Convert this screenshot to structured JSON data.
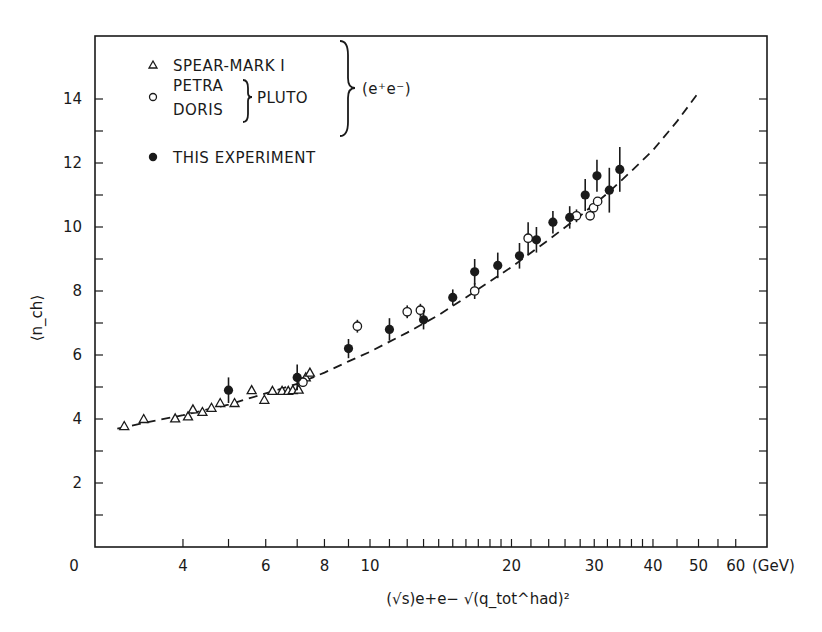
{
  "colors": {
    "ink": "#1a1a1a",
    "background": "#ffffff"
  },
  "chart_data": {
    "type": "scatter",
    "title": "",
    "xlabel": "(√s)e+e−  √(q_tot^had)²",
    "xunit": "(GeV)",
    "ylabel": "⟨n_ch⟩",
    "xscale": "log",
    "xlim": [
      2.35,
      70
    ],
    "ylim": [
      0,
      15.8
    ],
    "x_tick_labels": [
      {
        "value": 4,
        "label": "4"
      },
      {
        "value": 6,
        "label": "6"
      },
      {
        "value": 8,
        "label": "8"
      },
      {
        "value": 10,
        "label": "10"
      },
      {
        "value": 20,
        "label": "20"
      },
      {
        "value": 30,
        "label": "30"
      },
      {
        "value": 40,
        "label": "40"
      },
      {
        "value": 50,
        "label": "50"
      },
      {
        "value": 60,
        "label": "60"
      }
    ],
    "x_origin_label": "0",
    "x_minor_ticks": [
      4,
      5,
      6,
      7,
      8,
      9,
      10,
      11,
      12,
      13,
      14,
      15,
      16,
      17,
      18,
      19,
      20,
      22,
      24,
      26,
      28,
      30,
      32,
      34,
      36,
      38,
      40,
      45,
      50,
      55,
      60
    ],
    "y_tick_labels": [
      {
        "value": 2,
        "label": "2"
      },
      {
        "value": 4,
        "label": "4"
      },
      {
        "value": 6,
        "label": "6"
      },
      {
        "value": 8,
        "label": "8"
      },
      {
        "value": 10,
        "label": "10"
      },
      {
        "value": 12,
        "label": "12"
      },
      {
        "value": 14,
        "label": "14"
      }
    ],
    "y_origin_label": "0",
    "y_minor_ticks": [
      1,
      2,
      3,
      4,
      5,
      6,
      7,
      8,
      9,
      10,
      11,
      12,
      13,
      14
    ],
    "grid": false,
    "legend": {
      "position": "upper-left",
      "entries": [
        {
          "marker": "triangle-open",
          "label": "SPEAR-MARK I"
        },
        {
          "marker": "circle-open",
          "labels": [
            "PETRA",
            "DORIS"
          ],
          "group_label": "PLUTO"
        },
        {
          "marker": "circle-filled",
          "label": "THIS EXPERIMENT"
        }
      ],
      "outer_group_label": "(e⁺e⁻)"
    },
    "series": [
      {
        "name": "SPEAR-MARK I (e+e-)",
        "marker": "triangle-open",
        "points": [
          {
            "x": 3.0,
            "y": 3.78
          },
          {
            "x": 3.3,
            "y": 4.0
          },
          {
            "x": 3.85,
            "y": 4.02
          },
          {
            "x": 4.1,
            "y": 4.08
          },
          {
            "x": 4.2,
            "y": 4.3
          },
          {
            "x": 4.4,
            "y": 4.22
          },
          {
            "x": 4.6,
            "y": 4.35
          },
          {
            "x": 4.8,
            "y": 4.5
          },
          {
            "x": 5.15,
            "y": 4.5
          },
          {
            "x": 5.6,
            "y": 4.9
          },
          {
            "x": 5.96,
            "y": 4.6
          },
          {
            "x": 6.2,
            "y": 4.88
          },
          {
            "x": 6.5,
            "y": 4.88
          },
          {
            "x": 6.7,
            "y": 4.88
          },
          {
            "x": 6.85,
            "y": 4.9
          },
          {
            "x": 7.05,
            "y": 4.92
          },
          {
            "x": 7.3,
            "y": 5.3
          },
          {
            "x": 7.45,
            "y": 5.45
          }
        ]
      },
      {
        "name": "PETRA/DORIS PLUTO (e+e-)",
        "marker": "circle-open",
        "points": [
          {
            "x": 7.2,
            "y": 5.15,
            "err": 0.15
          },
          {
            "x": 9.4,
            "y": 6.9,
            "err": 0.2
          },
          {
            "x": 12.0,
            "y": 7.35,
            "err": 0.2
          },
          {
            "x": 12.8,
            "y": 7.4,
            "err": 0.2
          },
          {
            "x": 16.7,
            "y": 8.0,
            "err": 0.25
          },
          {
            "x": 21.7,
            "y": 9.65,
            "err": 0.5
          },
          {
            "x": 27.5,
            "y": 10.35,
            "err": 0.2
          },
          {
            "x": 29.4,
            "y": 10.35,
            "err": 0.0
          },
          {
            "x": 29.9,
            "y": 10.6,
            "err": 0.0
          },
          {
            "x": 30.5,
            "y": 10.8,
            "err": 0.0
          }
        ]
      },
      {
        "name": "THIS EXPERIMENT",
        "marker": "circle-filled",
        "points": [
          {
            "x": 5.0,
            "y": 4.9,
            "err": 0.4
          },
          {
            "x": 7.0,
            "y": 5.3,
            "err": 0.4
          },
          {
            "x": 9.0,
            "y": 6.2,
            "err": 0.3
          },
          {
            "x": 11.0,
            "y": 6.8,
            "err": 0.35
          },
          {
            "x": 13.0,
            "y": 7.1,
            "err": 0.3
          },
          {
            "x": 15.0,
            "y": 7.8,
            "err": 0.25
          },
          {
            "x": 16.7,
            "y": 8.6,
            "err": 0.4
          },
          {
            "x": 18.7,
            "y": 8.8,
            "err": 0.4
          },
          {
            "x": 20.8,
            "y": 9.1,
            "err": 0.4
          },
          {
            "x": 22.6,
            "y": 9.6,
            "err": 0.4
          },
          {
            "x": 24.5,
            "y": 10.15,
            "err": 0.35
          },
          {
            "x": 26.6,
            "y": 10.3,
            "err": 0.35
          },
          {
            "x": 28.7,
            "y": 11.0,
            "err": 0.5
          },
          {
            "x": 30.4,
            "y": 11.6,
            "err": 0.5
          },
          {
            "x": 32.3,
            "y": 11.15,
            "err": 0.7
          },
          {
            "x": 34.0,
            "y": 11.8,
            "err": 0.7
          }
        ]
      }
    ],
    "fit_curve": {
      "style": "dashed",
      "points": [
        {
          "x": 2.9,
          "y": 3.7
        },
        {
          "x": 3.5,
          "y": 3.95
        },
        {
          "x": 4.0,
          "y": 4.12
        },
        {
          "x": 5.0,
          "y": 4.45
        },
        {
          "x": 6.0,
          "y": 4.8
        },
        {
          "x": 7.0,
          "y": 5.1
        },
        {
          "x": 8.0,
          "y": 5.45
        },
        {
          "x": 9.0,
          "y": 5.8
        },
        {
          "x": 10.0,
          "y": 6.1
        },
        {
          "x": 12.0,
          "y": 6.7
        },
        {
          "x": 14.0,
          "y": 7.25
        },
        {
          "x": 16.0,
          "y": 7.8
        },
        {
          "x": 18.0,
          "y": 8.3
        },
        {
          "x": 20.0,
          "y": 8.75
        },
        {
          "x": 24.0,
          "y": 9.6
        },
        {
          "x": 28.0,
          "y": 10.35
        },
        {
          "x": 32.0,
          "y": 11.05
        },
        {
          "x": 36.0,
          "y": 11.75
        },
        {
          "x": 40.0,
          "y": 12.4
        },
        {
          "x": 45.0,
          "y": 13.3
        },
        {
          "x": 50.0,
          "y": 14.2
        }
      ]
    }
  }
}
